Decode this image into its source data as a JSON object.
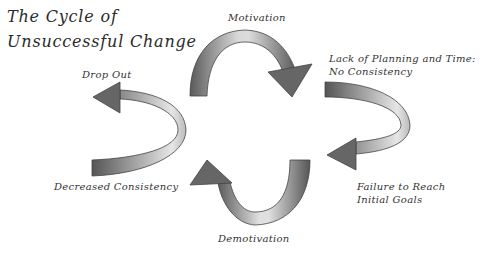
{
  "title": {
    "line1": "The Cycle of",
    "line2": "Unsuccessful Change"
  },
  "stages": [
    {
      "id": "motivation",
      "label": "Motivation"
    },
    {
      "id": "lack-of-planning",
      "label_line1": "Lack of Planning and Time:",
      "label_line2": "No Consistency"
    },
    {
      "id": "failure-to-reach",
      "label_line1": "Failure to Reach",
      "label_line2": "Initial Goals"
    },
    {
      "id": "demotivation",
      "label": "Demotivation"
    },
    {
      "id": "decreased-consistency",
      "label": "Decreased Consistency"
    },
    {
      "id": "drop-out",
      "label": "Drop Out"
    }
  ],
  "colors": {
    "arrow_dark": "#555555",
    "arrow_light": "#e8e8e8",
    "outline": "#444444",
    "text": "#333333"
  }
}
